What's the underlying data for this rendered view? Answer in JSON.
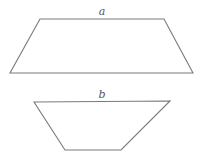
{
  "diagram": {
    "type": "geometric-shapes",
    "stroke_color": "#7a7a7a",
    "label_color": "#555555",
    "shapes": [
      {
        "name": "trapezoid-a",
        "label": "a",
        "label_position": [
          102,
          15
        ],
        "points": "40,19 164,19 193,73 10,73"
      },
      {
        "name": "trapezoid-b",
        "label": "b",
        "label_position": [
          102,
          98
        ],
        "points": "34,102 170,101 121,150 65,150"
      }
    ]
  }
}
